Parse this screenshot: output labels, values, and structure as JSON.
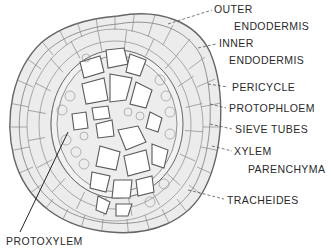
{
  "diagram": {
    "labels": [
      {
        "id": "outer_endodermis_1",
        "text": "OUTER",
        "x": 214,
        "y": 4
      },
      {
        "id": "outer_endodermis_2",
        "text": "ENDODERMIS",
        "x": 234,
        "y": 21
      },
      {
        "id": "inner_endodermis_1",
        "text": "INNER",
        "x": 219,
        "y": 38
      },
      {
        "id": "inner_endodermis_2",
        "text": "ENDODERMIS",
        "x": 229,
        "y": 55
      },
      {
        "id": "pericycle",
        "text": "PERICYCLE",
        "x": 232,
        "y": 82
      },
      {
        "id": "protophloem",
        "text": "PROTOPHLOEM",
        "x": 229,
        "y": 103
      },
      {
        "id": "sieve_tubes",
        "text": "SIEVE TUBES",
        "x": 235,
        "y": 124
      },
      {
        "id": "xylem_parenchyma_1",
        "text": "XYLEM",
        "x": 234,
        "y": 146
      },
      {
        "id": "xylem_parenchyma_2",
        "text": "PARENCHYMA",
        "x": 248,
        "y": 164
      },
      {
        "id": "tracheides",
        "text": "TRACHEIDES",
        "x": 227,
        "y": 195
      },
      {
        "id": "protoxylem",
        "text": "PROTOXYLEM",
        "x": 6,
        "y": 236
      }
    ],
    "colors": {
      "line": "#555555",
      "cell_fill": "#e6e6e6",
      "cell_stroke": "#6a6a6a",
      "background": "#ffffff"
    }
  }
}
